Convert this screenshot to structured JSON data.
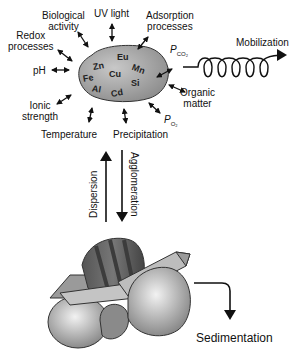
{
  "diagram": {
    "particle": {
      "elements": [
        "Eu",
        "Zn",
        "Mn",
        "Fe",
        "Cu",
        "Si",
        "Al",
        "Cd"
      ]
    },
    "factors": {
      "uv_light": "UV light",
      "biological_activity": [
        "Biological",
        "activity"
      ],
      "adsorption_processes": [
        "Adsorption",
        "processes"
      ],
      "redox_processes": [
        "Redox",
        "processes"
      ],
      "ph": "pH",
      "pco2": {
        "main": "P",
        "sub": "CO₂"
      },
      "organic_matter": [
        "Organic",
        "matter"
      ],
      "ionic_strength": [
        "Ionic",
        "strength"
      ],
      "po2": {
        "main": "P",
        "sub": "O₂"
      },
      "temperature": "Temperature",
      "precipitation": "Precipitation"
    },
    "processes": {
      "mobilization": "Mobilization",
      "dispersion": "Dispersion",
      "agglomeration": "Agglomeration",
      "sedimentation": "Sedimentation"
    },
    "colors": {
      "particle_fill": "#a9a9a9",
      "line": "#111111",
      "background": "#ffffff"
    }
  }
}
